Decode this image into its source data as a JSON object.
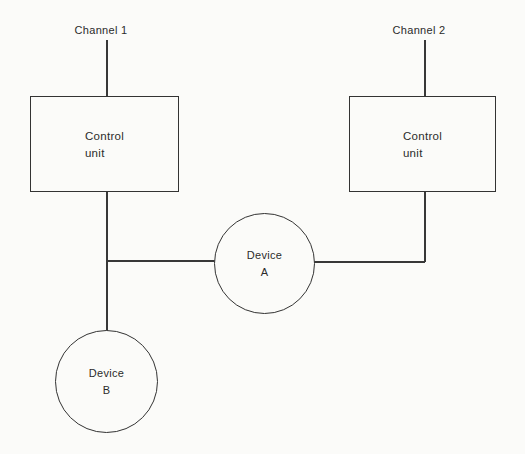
{
  "diagram": {
    "type": "block-diagram",
    "background_color": "#fbfbf9",
    "line_color": "#383838",
    "text_color": "#2b2b2b",
    "nodes": {
      "channel1": {
        "label": "Channel 1"
      },
      "channel2": {
        "label": "Channel 2"
      },
      "control_unit_1": {
        "shape": "rectangle",
        "line1": "Control",
        "line2": "unit"
      },
      "control_unit_2": {
        "shape": "rectangle",
        "line1": "Control",
        "line2": "unit"
      },
      "device_a": {
        "shape": "circle",
        "line1": "Device",
        "line2": "A"
      },
      "device_b": {
        "shape": "circle",
        "line1": "Device",
        "line2": "B"
      }
    },
    "edges": [
      {
        "from": "channel1",
        "to": "control_unit_1"
      },
      {
        "from": "channel2",
        "to": "control_unit_2"
      },
      {
        "from": "control_unit_1",
        "to": "device_b"
      },
      {
        "from": "control_unit_1",
        "to": "device_a"
      },
      {
        "from": "control_unit_2",
        "to": "device_a"
      }
    ]
  }
}
